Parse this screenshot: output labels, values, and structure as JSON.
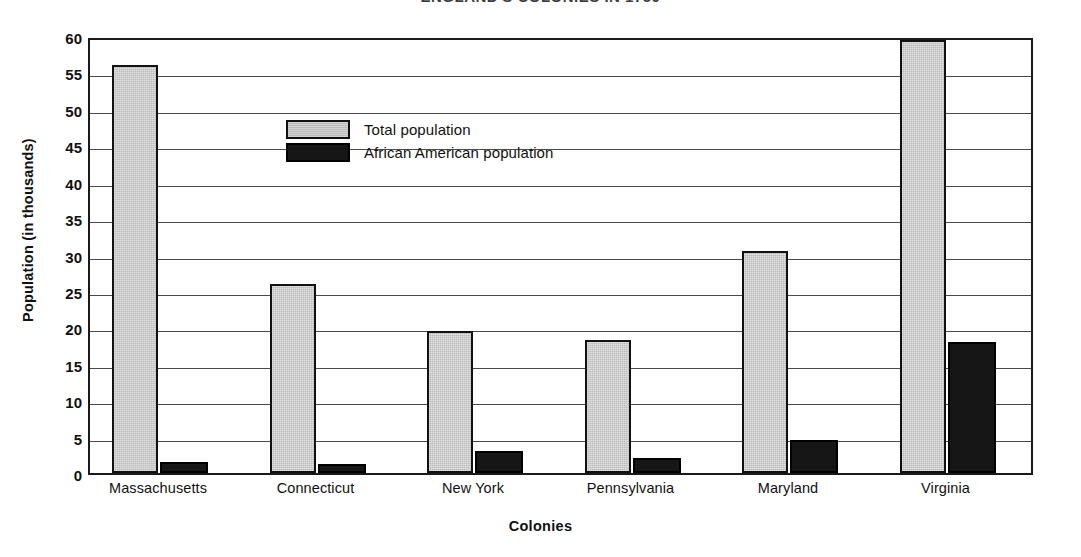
{
  "chart_data": {
    "type": "bar",
    "title": "ENGLAND'S COLONIES IN 1750",
    "xlabel": "Colonies",
    "ylabel": "Population (in thousands)",
    "ylim": [
      0,
      60
    ],
    "ytick_step": 5,
    "yticks": [
      "60",
      "55",
      "50",
      "45",
      "40",
      "35",
      "30",
      "25",
      "20",
      "15",
      "10",
      "5",
      "0"
    ],
    "ytick_values": [
      60,
      55,
      50,
      45,
      40,
      35,
      30,
      25,
      20,
      15,
      10,
      5,
      0
    ],
    "grid": true,
    "legend_position": "upper-left-inside",
    "categories": [
      "Massachusetts",
      "Connecticut",
      "New York",
      "Pennsylvania",
      "Maryland",
      "Virginia"
    ],
    "series": [
      {
        "name": "Total population",
        "color": "#bcbcbc",
        "values": [
          56,
          26,
          19.5,
          18.3,
          30.5,
          59.5
        ]
      },
      {
        "name": "African American population",
        "color": "#161616",
        "values": [
          1.5,
          1.2,
          3,
          2,
          4.5,
          18
        ]
      }
    ]
  }
}
